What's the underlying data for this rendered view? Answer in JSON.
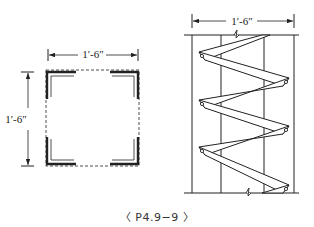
{
  "figure": {
    "caption": "〈 P4.9−9 〉",
    "left_view": {
      "name": "column cross-section",
      "top_dimension": "1′-6″",
      "side_dimension": "1′-6″"
    },
    "right_view": {
      "name": "lacing elevation",
      "top_dimension": "1′-6″"
    }
  }
}
